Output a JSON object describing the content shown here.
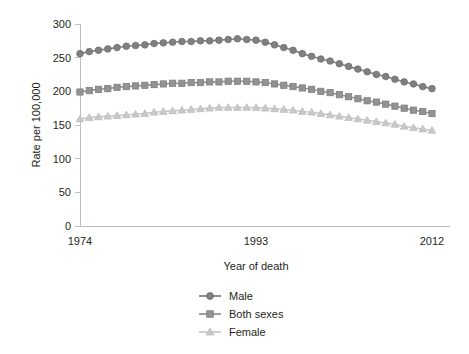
{
  "chart_data": {
    "type": "line",
    "title": "",
    "xlabel": "Year of death",
    "ylabel": "Rate per 100,000",
    "xlim": [
      1974,
      2012
    ],
    "ylim": [
      0,
      300
    ],
    "yticks": [
      0,
      50,
      100,
      150,
      200,
      250,
      300
    ],
    "xticks": [
      1974,
      1993,
      2012
    ],
    "xtick_labels": [
      "1974",
      "1993",
      "2012"
    ],
    "ytick_labels": [
      "0",
      "50",
      "100",
      "150",
      "200",
      "250",
      "300"
    ],
    "grid": false,
    "legend_position": "bottom-center",
    "x": [
      1974,
      1975,
      1976,
      1977,
      1978,
      1979,
      1980,
      1981,
      1982,
      1983,
      1984,
      1985,
      1986,
      1987,
      1988,
      1989,
      1990,
      1991,
      1992,
      1993,
      1994,
      1995,
      1996,
      1997,
      1998,
      1999,
      2000,
      2001,
      2002,
      2003,
      2004,
      2005,
      2006,
      2007,
      2008,
      2009,
      2010,
      2011,
      2012
    ],
    "series": [
      {
        "name": "Male",
        "marker": "circle",
        "color": "#808080",
        "values": [
          256,
          259,
          261,
          263,
          265,
          267,
          268,
          269,
          271,
          272,
          273,
          274,
          274,
          275,
          275,
          276,
          277,
          278,
          277,
          276,
          273,
          269,
          265,
          261,
          256,
          252,
          248,
          245,
          241,
          237,
          233,
          229,
          225,
          222,
          218,
          214,
          211,
          207,
          204
        ]
      },
      {
        "name": "Both sexes",
        "marker": "square",
        "color": "#939393",
        "values": [
          199,
          201,
          203,
          204,
          206,
          207,
          208,
          209,
          210,
          211,
          212,
          212,
          213,
          213,
          214,
          214,
          215,
          215,
          215,
          214,
          213,
          211,
          209,
          207,
          205,
          203,
          200,
          198,
          195,
          192,
          189,
          186,
          184,
          181,
          178,
          175,
          172,
          170,
          167
        ]
      },
      {
        "name": "Female",
        "marker": "triangle",
        "color": "#c9c9c9",
        "values": [
          159,
          161,
          162,
          163,
          164,
          165,
          166,
          167,
          169,
          170,
          171,
          172,
          173,
          174,
          175,
          176,
          176,
          176,
          176,
          176,
          175,
          174,
          173,
          172,
          170,
          169,
          167,
          165,
          163,
          161,
          159,
          157,
          155,
          153,
          151,
          148,
          146,
          144,
          142
        ]
      }
    ]
  },
  "legend": {
    "items": [
      {
        "label": "Male"
      },
      {
        "label": "Both sexes"
      },
      {
        "label": "Female"
      }
    ]
  }
}
